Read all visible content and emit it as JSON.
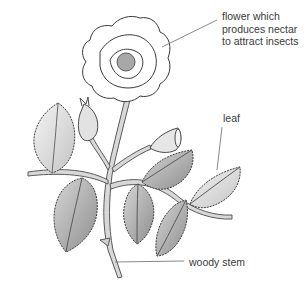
{
  "diagram": {
    "labels": {
      "flower": [
        "flower which",
        "produces nectar",
        "to attract insects"
      ],
      "leaf": "leaf",
      "stem": "woody stem"
    },
    "colors": {
      "ink": "#4a4a4a",
      "leaf_fill": "#bdbdbd",
      "leaf_dark": "#8c8c8c",
      "flower_fill": "#ffffff",
      "center_fill": "#a8a8a8",
      "label_text": "#3a3a3a",
      "leader_line": "#6a6a6a"
    }
  }
}
